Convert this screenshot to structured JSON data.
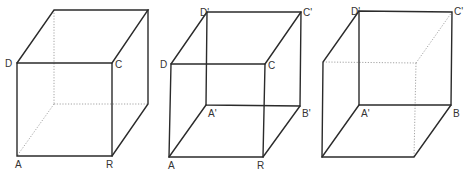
{
  "figures": [
    {
      "id": "cube-1",
      "description": "Cube with front face ABCD visible, hidden back edges dotted",
      "labels": {
        "A": "A",
        "B": "R",
        "C": "C",
        "D": "D"
      }
    },
    {
      "id": "cube-2",
      "description": "Cube with all edges drawn solid (wireframe)",
      "labels": {
        "A": "A",
        "B": "R",
        "C": "C",
        "D": "D",
        "A1": "A'",
        "B1": "B'",
        "C1": "C'",
        "D1": "D'"
      }
    },
    {
      "id": "cube-3",
      "description": "Cube viewed with back face A'BC'D' in front, front-right edges dotted",
      "labels": {
        "A1": "A'",
        "B": "B",
        "C1": "C'",
        "D1": "D'"
      }
    }
  ],
  "colors": {
    "line": "#2b2b2b",
    "hidden_line": "#9a9a9a",
    "background": "#ffffff"
  }
}
